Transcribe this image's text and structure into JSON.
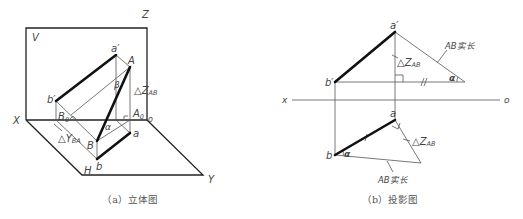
{
  "left_figure": {
    "caption": "（a）立体图",
    "labels": {
      "V": "V",
      "Z": "Z",
      "X": "X",
      "H": "H",
      "Y": "Y",
      "O": "o",
      "a_prime": "a′",
      "b_prime": "b′",
      "A": "A",
      "B": "B",
      "a": "a",
      "b": "b",
      "Bo": "B",
      "Bo_sub": "0",
      "Ao": "A",
      "Ao_sub": "0",
      "beta": "β",
      "alpha": "α",
      "dZ": "△Z",
      "dZ_sub": "AB",
      "dY": "△Y",
      "dY_sub": "BA"
    }
  },
  "right_figure": {
    "caption": "（b）投影图",
    "labels": {
      "x": "x",
      "o": "o",
      "a_prime": "a′",
      "b_prime": "b′",
      "a": "a",
      "b": "b",
      "alpha_top": "α",
      "alpha_bottom": "α",
      "dZ_top": "△Z",
      "dZ_top_sub": "AB",
      "dZ_bottom": "△Z",
      "dZ_bottom_sub": "AB",
      "true_length_top": "AB实长",
      "true_length_bottom": "AB实长"
    }
  },
  "colors": {
    "line": "#111111",
    "thin_line": "#555555",
    "text": "#444444",
    "background": "#ffffff"
  }
}
